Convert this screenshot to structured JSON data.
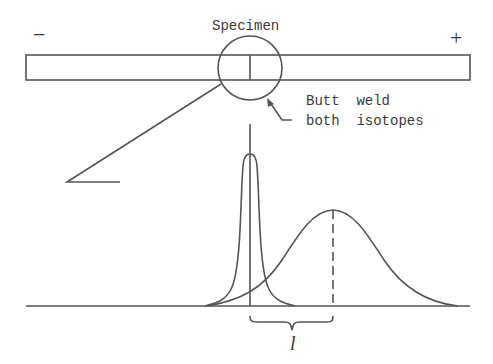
{
  "diagram": {
    "labels": {
      "minus": "−",
      "plus": "+",
      "specimen": "Specimen",
      "weld_line1": "Butt  weld",
      "weld_line2": "both  isotopes",
      "distance": "l"
    },
    "elements": {
      "specimen_bar": "horizontal rectangular rod between − and + electrodes",
      "weld_circle": "magnifier circle around the butt weld",
      "narrow_peak": "initial sharp isotope distribution at weld position",
      "broad_peak": "diffused isotope distribution shifted toward + side",
      "peak_marker": "dashed vertical line at broad peak maximum",
      "distance_brace": "brace indicating shift distance l between peaks"
    },
    "colors": {
      "line": "#555555",
      "text": "#3a3a3a",
      "background": "#ffffff"
    }
  }
}
